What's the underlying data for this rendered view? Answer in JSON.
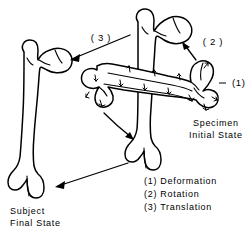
{
  "figure": {
    "background_color": "#ffffff",
    "line_color": "#000000"
  },
  "annotations": {
    "translation_label": "( 3 )",
    "rotation_label": "( 2 )",
    "deformation_label": "(1)"
  },
  "captions": {
    "specimen": {
      "line1": "Specimen",
      "line2": "Initial State"
    },
    "subject": {
      "line1": "Subject",
      "line2": "Final State"
    }
  },
  "legend": {
    "items": [
      {
        "marker": "(1)",
        "label": "Deformation"
      },
      {
        "marker": "(2)",
        "label": "Rotation"
      },
      {
        "marker": "(3)",
        "label": "Translation"
      }
    ],
    "lines": [
      "(1) Deformation",
      "(2) Rotation",
      "(3) Translation"
    ]
  },
  "objects": {
    "bone_final": "subject-final-state-femur",
    "bone_rotated": "rotated-femur",
    "bone_initial": "specimen-initial-state-femur"
  }
}
